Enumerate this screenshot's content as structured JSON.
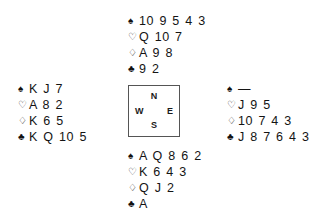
{
  "diagram": {
    "type": "bridge-deal-diagram",
    "suit_symbols": {
      "spade": "♠",
      "heart": "♡",
      "diamond": "♢",
      "club": "♣"
    },
    "compass": {
      "north": "N",
      "south": "S",
      "west": "W",
      "east": "E"
    },
    "hands": {
      "north": {
        "spades": "10 9 5 4 3",
        "hearts": "Q 10 7",
        "diamonds": "A 9 8",
        "clubs": "9 2"
      },
      "west": {
        "spades": "K J 7",
        "hearts": "A 8 2",
        "diamonds": "K 6 5",
        "clubs": "K Q 10 5"
      },
      "east": {
        "spades": "—",
        "hearts": "J 9 5",
        "diamonds": "10 7 4 3",
        "clubs": "J 8 7 6 4 3"
      },
      "south": {
        "spades": "A Q 8 6 2",
        "hearts": "K 6 4 3",
        "diamonds": "Q J 2",
        "clubs": "A"
      }
    }
  }
}
